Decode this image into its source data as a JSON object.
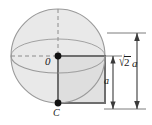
{
  "figure": {
    "labels": {
      "origin": "0",
      "center_bottom": "C",
      "diagonal_radical": "√",
      "diagonal_radicand": "2",
      "diagonal_variable": "a",
      "side": "a"
    },
    "dimensions": {
      "diagonal_text": "√2 a",
      "side_text": "a"
    },
    "colors": {
      "sphere_fill": "#e9e9e9",
      "sphere_stroke": "#9a9a9a",
      "square_fill": "#dcdcdc",
      "square_stroke": "#6e6e6e",
      "dashed_stroke": "#8c8c8c",
      "dimension_stroke": "#4a4a4a",
      "point_fill": "#111111",
      "text_color": "#1a1a1a",
      "background": "#ffffff"
    },
    "geometry": {
      "circle_center_x": 58,
      "circle_center_y": 56,
      "circle_radius": 47,
      "equator_ry": 17,
      "square_left": 58,
      "square_top": 56,
      "square_size": 47,
      "dim_extension_top_y": 33,
      "dim_extension_bottom_y": 109,
      "dim_outer_x": 137,
      "dim_inner_x": 113,
      "point_radius": 3.2
    }
  }
}
